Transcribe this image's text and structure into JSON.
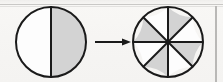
{
  "document": {
    "type": "fraction-equivalence-diagram",
    "background_color": "#f6f5f3",
    "ink_color": "#1a1a1a",
    "shade_color": "#d3d3d3",
    "unshaded_color": "#fdfdfd",
    "rule_color": "#c2c1bf"
  },
  "figures": [
    {
      "id": "left-circle",
      "name": "circle-halves",
      "center_x": 51,
      "center_y": 42,
      "radius": 35,
      "sectors_total": 2,
      "sectors_shaded": 1,
      "fraction": "1/2",
      "divider_angles_deg": [
        90,
        270
      ],
      "shaded_sector_indices": [
        1
      ],
      "stroke_width": 2
    },
    {
      "id": "arrow",
      "name": "transformation-arrow",
      "x1": 95,
      "y1": 42,
      "x2": 131,
      "y2": 42,
      "direction": "right",
      "head_length": 9,
      "head_width": 7,
      "stroke_width": 2
    },
    {
      "id": "right-circle",
      "name": "circle-eighths",
      "center_x": 168,
      "center_y": 42,
      "radius": 35,
      "sectors_total": 8,
      "sectors_shaded": 4,
      "fraction": "4/8",
      "divider_angles_deg": [
        0,
        45,
        90,
        135,
        180,
        225,
        270,
        315
      ],
      "shaded_sector_indices": [
        1,
        3,
        5,
        7
      ],
      "stroke_width": 2
    }
  ],
  "relation": {
    "meaning": "one half equals four eighths",
    "left_fraction": "1/2",
    "right_fraction": "4/8"
  }
}
